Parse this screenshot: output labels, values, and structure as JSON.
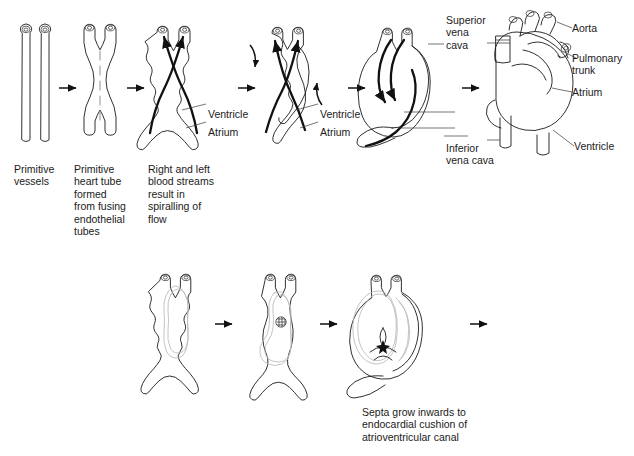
{
  "figure": {
    "background": "#ffffff",
    "line_color": "#1a1a1a",
    "endocardium_color": "#b9b9b9",
    "flow_color": "#111111"
  },
  "top_row": {
    "stages": [
      {
        "id": "primitive-vessels",
        "caption": "Primitive\nvessels"
      },
      {
        "id": "primitive-heart-tube",
        "caption": "Primitive\nheart tube\nformed\nfrom fusing\nendothelial\ntubes"
      },
      {
        "id": "spiralling-flow",
        "caption": "Right and left\nblood streams\nresult in\nspiralling of\nflow"
      },
      {
        "id": "looping-heart",
        "caption": ""
      },
      {
        "id": "looped-heart",
        "caption": ""
      },
      {
        "id": "mature-heart",
        "caption": ""
      }
    ],
    "labels": [
      {
        "id": "ventricle-1",
        "text": "Ventricle"
      },
      {
        "id": "atrium-1",
        "text": "Atrium"
      },
      {
        "id": "ventricle-2",
        "text": "Ventricle"
      },
      {
        "id": "atrium-2",
        "text": "Atrium"
      },
      {
        "id": "superior-vena-cava",
        "text": "Superior\nvena\ncava"
      },
      {
        "id": "inferior-vena-cava",
        "text": "Inferior\nvena cava"
      },
      {
        "id": "aorta",
        "text": "Aorta"
      },
      {
        "id": "pulmonary-trunk",
        "text": "Pulmonary\ntrunk"
      },
      {
        "id": "atrium-mature",
        "text": "Atrium"
      },
      {
        "id": "ventricle-mature",
        "text": "Ventricle"
      }
    ]
  },
  "bottom_row": {
    "stages": [
      {
        "id": "section-stage-1",
        "caption": ""
      },
      {
        "id": "section-stage-2",
        "caption": ""
      },
      {
        "id": "section-stage-3",
        "caption": "Septa grow inwards to\nendocardial cushion of\natrioventricular canal"
      }
    ]
  }
}
